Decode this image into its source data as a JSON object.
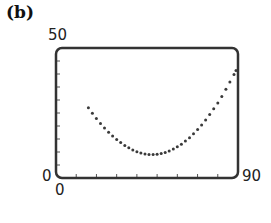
{
  "panel_label": "(b)",
  "labels": {
    "ymax": "50",
    "ymin": "0",
    "xmin": "0",
    "xmax": "90"
  },
  "colors": {
    "frame": "#333333",
    "dots": "#3a3a3a",
    "ticks": "#555555"
  },
  "chart_data": {
    "type": "scatter",
    "title": "(b)",
    "xlabel": "",
    "ylabel": "",
    "xlim": [
      0,
      90
    ],
    "ylim": [
      0,
      50
    ],
    "x_tick_step": 10,
    "y_tick_step": 5,
    "grid": false,
    "legend": null,
    "tick_labels": {
      "x": [
        "0",
        "90"
      ],
      "y": [
        "0",
        "50"
      ]
    },
    "series": [
      {
        "name": "dotted curve",
        "style": "dots",
        "model": "quadratic, min near (48, 9)",
        "x": [
          16,
          18,
          20,
          22,
          24,
          26,
          28,
          30,
          32,
          34,
          36,
          38,
          40,
          42,
          44,
          46,
          48,
          50,
          52,
          54,
          56,
          58,
          60,
          62,
          64,
          66,
          68,
          70,
          72,
          74,
          76,
          78,
          80,
          82,
          84,
          86,
          88,
          89
        ],
        "y": [
          27.0,
          24.9,
          22.9,
          21.0,
          19.2,
          17.6,
          16.1,
          14.8,
          13.6,
          12.5,
          11.6,
          10.8,
          10.1,
          9.6,
          9.2,
          9.0,
          9.0,
          9.1,
          9.4,
          9.8,
          10.4,
          11.1,
          12.0,
          13.0,
          14.2,
          15.5,
          17.0,
          18.6,
          20.4,
          22.3,
          24.4,
          26.6,
          28.9,
          31.4,
          34.1,
          36.9,
          39.8,
          41.3
        ]
      }
    ]
  }
}
